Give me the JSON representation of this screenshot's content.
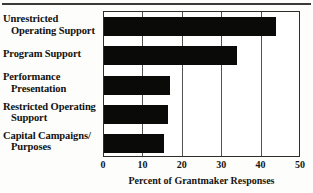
{
  "figure": {
    "background_color": "#ffffff",
    "bar_color": "#0a0a09",
    "axis_color": "#2e2e2c",
    "grid_color": "#53534f"
  },
  "chart_data": {
    "type": "bar",
    "orientation": "horizontal",
    "title": "",
    "xlabel": "Percent of Grantmaker Responses",
    "ylabel": "",
    "categories": [
      "Unrestricted Operating Support",
      "Program Support",
      "Performance Presentation",
      "Restricted Operating Support",
      "Capital Campaigns/ Purposes"
    ],
    "category_lines": [
      [
        "Unrestricted",
        "Operating Support"
      ],
      [
        "Program Support",
        ""
      ],
      [
        "Performance",
        "Presentation"
      ],
      [
        "Restricted Operating",
        "Support"
      ],
      [
        "Capital Campaigns/",
        "Purposes"
      ]
    ],
    "values": [
      44,
      34,
      17,
      16.5,
      15.5
    ],
    "xlim": [
      0,
      50
    ],
    "xticks": [
      0,
      10,
      20,
      30,
      40,
      50
    ],
    "xtick_labels": [
      "0",
      "10",
      "20",
      "30",
      "40",
      "50"
    ],
    "grid": "vertical",
    "legend": "none"
  }
}
